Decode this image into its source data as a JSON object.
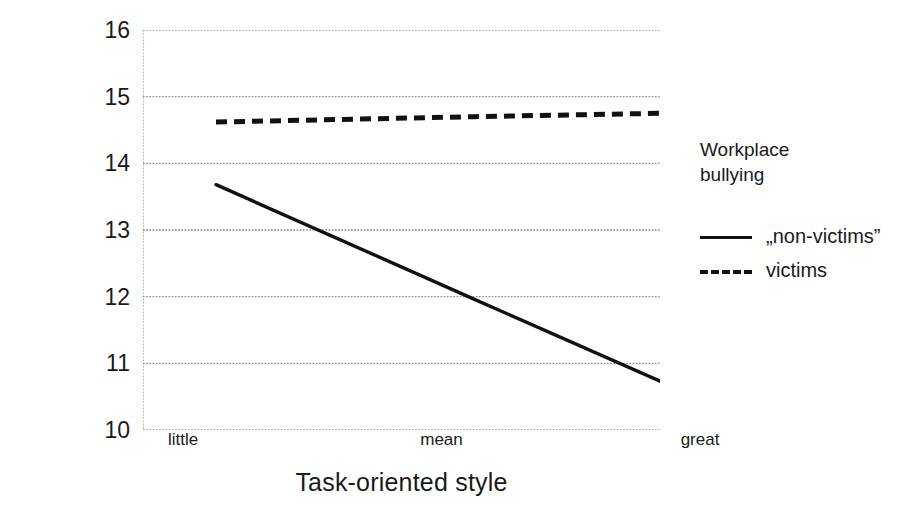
{
  "chart_data": {
    "type": "line",
    "title": "",
    "xlabel": "Task-oriented style",
    "ylabel": "Mental health disorders",
    "categories": [
      "little",
      "mean",
      "great"
    ],
    "xtick_labels": [
      "little",
      "mean",
      "great"
    ],
    "ytick_labels": [
      "16",
      "15",
      "14",
      "13",
      "12",
      "11",
      "10"
    ],
    "ylim": [
      10,
      16
    ],
    "yticks": [
      10,
      11,
      12,
      13,
      14,
      15,
      16
    ],
    "grid": true,
    "grid_style": "dotted",
    "legend_position": "right",
    "legend_title": "Workplace\nbullying",
    "series": [
      {
        "name": "„non-victims”",
        "style": "solid",
        "color": "#111111",
        "values": [
          13.68,
          11.96,
          10.25
        ]
      },
      {
        "name": "victims",
        "style": "dashed",
        "color": "#111111",
        "values": [
          14.62,
          14.7,
          14.77
        ]
      }
    ]
  },
  "axes": {
    "y_title": "Mental health disorders",
    "x_title": "Task-oriented style"
  },
  "legend": {
    "title_line1": "Workplace",
    "title_line2": "bullying",
    "items": [
      {
        "label": "„non-victims”",
        "style": "solid"
      },
      {
        "label": "victims",
        "style": "dashed"
      }
    ]
  },
  "colors": {
    "ink": "#111111",
    "grid": "#8a8a8a",
    "background": "#ffffff"
  }
}
